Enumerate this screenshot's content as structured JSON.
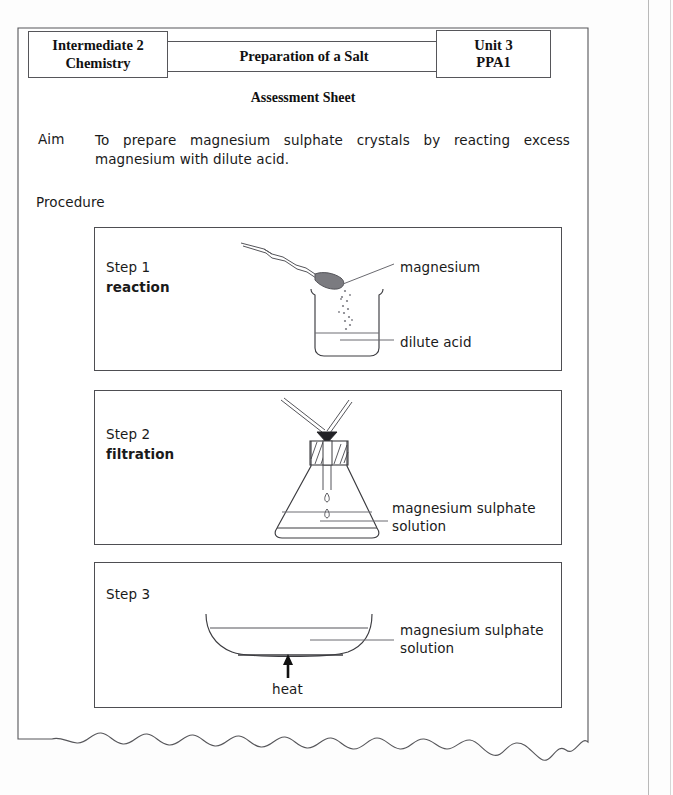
{
  "document": {
    "header": {
      "left_box": "Intermediate 2\nChemistry",
      "left_box_line1": "Intermediate 2",
      "left_box_line2": "Chemistry",
      "middle_box": "Preparation of a Salt",
      "right_box_line1": "Unit 3",
      "right_box_line2": "PPA1"
    },
    "title": "Assessment Sheet",
    "aim": {
      "label": "Aim",
      "text": "To prepare magnesium sulphate crystals by reacting excess magnesium with dilute acid."
    },
    "procedure": {
      "label": "Procedure",
      "steps": [
        {
          "number": "Step 1",
          "name": "reaction",
          "labels": [
            {
              "id": "magnesium",
              "text": "magnesium"
            },
            {
              "id": "dilute-acid",
              "text": "dilute acid"
            }
          ],
          "apparatus": "beaker-with-spatula"
        },
        {
          "number": "Step 2",
          "name": "filtration",
          "labels": [
            {
              "id": "magnesium-sulphate-solution",
              "text": "magnesium sulphate\nsolution"
            }
          ],
          "apparatus": "conical-flask-with-filter-funnel"
        },
        {
          "number": "Step 3",
          "name": "",
          "labels": [
            {
              "id": "magnesium-sulphate-solution",
              "text": "magnesium sulphate\nsolution"
            },
            {
              "id": "heat",
              "text": "heat"
            }
          ],
          "apparatus": "evaporating-basin-with-heat"
        }
      ]
    }
  },
  "colors": {
    "ink": "#1a1a1a",
    "line": "#3c3c40",
    "box_border": "#4e4e52",
    "header_border": "#56565a",
    "paper": "#ffffff",
    "scan_background": "#fdfdfd",
    "leader_line": "#6a6a70"
  }
}
